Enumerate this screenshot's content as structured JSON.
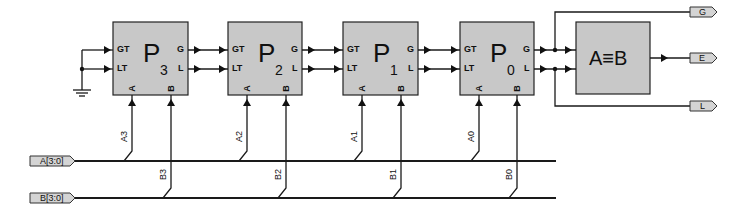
{
  "diagram": {
    "blocks": [
      {
        "id": "P3",
        "label": "P",
        "sub": "3",
        "x": 113
      },
      {
        "id": "P2",
        "label": "P",
        "sub": "2",
        "x": 228
      },
      {
        "id": "P1",
        "label": "P",
        "sub": "1",
        "x": 343
      },
      {
        "id": "P0",
        "label": "P",
        "sub": "0",
        "x": 460
      }
    ],
    "pins": {
      "gt": "GT",
      "lt": "LT",
      "g": "G",
      "l": "L",
      "a": "A",
      "b": "B"
    },
    "comparator": {
      "label": "A≡B"
    },
    "outputs": {
      "g": "G",
      "e": "E",
      "l": "L"
    },
    "inputs": {
      "a_bus": "A[3:0]",
      "b_bus": "B[3:0]"
    },
    "a_taps": [
      "A3",
      "A2",
      "A1",
      "A0"
    ],
    "b_taps": [
      "B3",
      "B2",
      "B1",
      "B0"
    ]
  }
}
